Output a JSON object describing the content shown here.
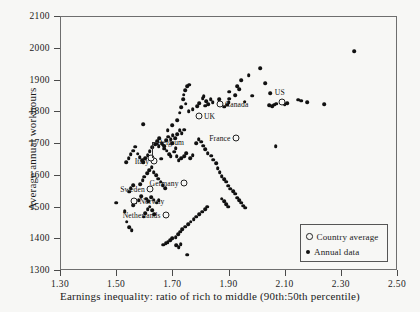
{
  "chart_data": {
    "type": "scatter",
    "title": "",
    "xlabel": "Earnings inequality: ratio of rich to middle (90th:50th percentile)",
    "ylabel": "Average annual workhours",
    "xlim": [
      1.3,
      2.5
    ],
    "ylim": [
      1300,
      2100
    ],
    "xticks": [
      "1.30",
      "1.50",
      "1.70",
      "1.90",
      "2.10",
      "2.30",
      "2.50"
    ],
    "xtick_values": [
      1.3,
      1.5,
      1.7,
      1.9,
      2.1,
      2.3,
      2.5
    ],
    "yticks": [
      "1300",
      "1400",
      "1500",
      "1600",
      "1700",
      "1800",
      "1900",
      "2000",
      "2100"
    ],
    "ytick_values": [
      1300,
      1400,
      1500,
      1600,
      1700,
      1800,
      1900,
      2000,
      2100
    ],
    "grid": false,
    "legend_position": "bottom-right",
    "legend": [
      {
        "marker": "open-circle",
        "label": "Country average"
      },
      {
        "marker": "filled-dot",
        "label": "Annual data"
      }
    ],
    "country_averages": [
      {
        "name": "Norway",
        "x": 1.565,
        "y": 1516,
        "label_side": "right"
      },
      {
        "name": "Sweden",
        "x": 1.62,
        "y": 1555,
        "label_side": "left"
      },
      {
        "name": "Netherlands",
        "x": 1.676,
        "y": 1472,
        "label_side": "left"
      },
      {
        "name": "Germany",
        "x": 1.74,
        "y": 1574,
        "label_side": "left"
      },
      {
        "name": "Italy",
        "x": 1.635,
        "y": 1643,
        "label_side": "left"
      },
      {
        "name": "Belgium",
        "x": 1.625,
        "y": 1654,
        "label_side": "leader"
      },
      {
        "name": "UK",
        "x": 1.795,
        "y": 1785,
        "label_side": "right"
      },
      {
        "name": "Canada",
        "x": 1.87,
        "y": 1822,
        "label_side": "right"
      },
      {
        "name": "France",
        "x": 1.925,
        "y": 1717,
        "label_side": "left"
      },
      {
        "name": "US",
        "x": 2.09,
        "y": 1828,
        "label_side": "above"
      }
    ],
    "annual_data": [
      {
        "x": 2.348,
        "y": 1990
      },
      {
        "x": 2.012,
        "y": 1935
      },
      {
        "x": 1.972,
        "y": 1913
      },
      {
        "x": 1.946,
        "y": 1898
      },
      {
        "x": 2.031,
        "y": 1888
      },
      {
        "x": 1.932,
        "y": 1879
      },
      {
        "x": 1.938,
        "y": 1869
      },
      {
        "x": 1.903,
        "y": 1862
      },
      {
        "x": 2.048,
        "y": 1856
      },
      {
        "x": 1.924,
        "y": 1851
      },
      {
        "x": 1.902,
        "y": 1839
      },
      {
        "x": 1.901,
        "y": 1829
      },
      {
        "x": 1.985,
        "y": 1849
      },
      {
        "x": 1.867,
        "y": 1838
      },
      {
        "x": 1.958,
        "y": 1830
      },
      {
        "x": 1.896,
        "y": 1820
      },
      {
        "x": 1.884,
        "y": 1814
      },
      {
        "x": 2.18,
        "y": 1828
      },
      {
        "x": 2.148,
        "y": 1836
      },
      {
        "x": 2.158,
        "y": 1833
      },
      {
        "x": 2.11,
        "y": 1826
      },
      {
        "x": 2.1,
        "y": 1822
      },
      {
        "x": 2.07,
        "y": 1824
      },
      {
        "x": 2.062,
        "y": 1820
      },
      {
        "x": 2.24,
        "y": 1822
      },
      {
        "x": 2.056,
        "y": 1816
      },
      {
        "x": 2.044,
        "y": 1819
      },
      {
        "x": 1.82,
        "y": 1832
      },
      {
        "x": 1.836,
        "y": 1838
      },
      {
        "x": 1.844,
        "y": 1828
      },
      {
        "x": 1.828,
        "y": 1822
      },
      {
        "x": 1.816,
        "y": 1818
      },
      {
        "x": 1.808,
        "y": 1842
      },
      {
        "x": 1.812,
        "y": 1848
      },
      {
        "x": 1.796,
        "y": 1826
      },
      {
        "x": 1.788,
        "y": 1816
      },
      {
        "x": 1.772,
        "y": 1806
      },
      {
        "x": 1.758,
        "y": 1800
      },
      {
        "x": 1.748,
        "y": 1824
      },
      {
        "x": 1.74,
        "y": 1852
      },
      {
        "x": 1.745,
        "y": 1866
      },
      {
        "x": 1.752,
        "y": 1878
      },
      {
        "x": 1.76,
        "y": 1884
      },
      {
        "x": 1.738,
        "y": 1838
      },
      {
        "x": 1.732,
        "y": 1812
      },
      {
        "x": 1.726,
        "y": 1796
      },
      {
        "x": 1.718,
        "y": 1772
      },
      {
        "x": 1.7,
        "y": 1756
      },
      {
        "x": 1.684,
        "y": 1740
      },
      {
        "x": 1.66,
        "y": 1650
      },
      {
        "x": 1.596,
        "y": 1760
      },
      {
        "x": 1.645,
        "y": 1700
      },
      {
        "x": 1.652,
        "y": 1690
      },
      {
        "x": 1.666,
        "y": 1695
      },
      {
        "x": 1.672,
        "y": 1682
      },
      {
        "x": 1.68,
        "y": 1676
      },
      {
        "x": 1.688,
        "y": 1664
      },
      {
        "x": 1.694,
        "y": 1658
      },
      {
        "x": 1.706,
        "y": 1672
      },
      {
        "x": 1.712,
        "y": 1684
      },
      {
        "x": 1.7,
        "y": 1700
      },
      {
        "x": 1.716,
        "y": 1658
      },
      {
        "x": 1.722,
        "y": 1646
      },
      {
        "x": 1.732,
        "y": 1652
      },
      {
        "x": 1.742,
        "y": 1658
      },
      {
        "x": 1.75,
        "y": 1668
      },
      {
        "x": 1.764,
        "y": 1652
      },
      {
        "x": 1.772,
        "y": 1662
      },
      {
        "x": 1.786,
        "y": 1700
      },
      {
        "x": 1.794,
        "y": 1712
      },
      {
        "x": 1.802,
        "y": 1704
      },
      {
        "x": 1.81,
        "y": 1692
      },
      {
        "x": 1.818,
        "y": 1680
      },
      {
        "x": 1.826,
        "y": 1668
      },
      {
        "x": 1.838,
        "y": 1660
      },
      {
        "x": 1.846,
        "y": 1648
      },
      {
        "x": 1.856,
        "y": 1636
      },
      {
        "x": 1.862,
        "y": 1620
      },
      {
        "x": 1.868,
        "y": 1608
      },
      {
        "x": 1.876,
        "y": 1596
      },
      {
        "x": 1.884,
        "y": 1586
      },
      {
        "x": 1.892,
        "y": 1578
      },
      {
        "x": 1.898,
        "y": 1566
      },
      {
        "x": 1.906,
        "y": 1556
      },
      {
        "x": 1.916,
        "y": 1548
      },
      {
        "x": 1.924,
        "y": 1540
      },
      {
        "x": 1.93,
        "y": 1528
      },
      {
        "x": 1.938,
        "y": 1520
      },
      {
        "x": 1.946,
        "y": 1512
      },
      {
        "x": 1.952,
        "y": 1502
      },
      {
        "x": 1.96,
        "y": 1496
      },
      {
        "x": 1.876,
        "y": 1524
      },
      {
        "x": 1.884,
        "y": 1516
      },
      {
        "x": 1.892,
        "y": 1508
      },
      {
        "x": 1.898,
        "y": 1500
      },
      {
        "x": 1.824,
        "y": 1500
      },
      {
        "x": 1.816,
        "y": 1492
      },
      {
        "x": 1.806,
        "y": 1484
      },
      {
        "x": 1.796,
        "y": 1476
      },
      {
        "x": 1.786,
        "y": 1468
      },
      {
        "x": 1.776,
        "y": 1460
      },
      {
        "x": 1.766,
        "y": 1452
      },
      {
        "x": 1.756,
        "y": 1444
      },
      {
        "x": 1.746,
        "y": 1436
      },
      {
        "x": 1.736,
        "y": 1428
      },
      {
        "x": 1.728,
        "y": 1420
      },
      {
        "x": 1.72,
        "y": 1412
      },
      {
        "x": 1.712,
        "y": 1404
      },
      {
        "x": 1.7,
        "y": 1400
      },
      {
        "x": 1.692,
        "y": 1394
      },
      {
        "x": 1.684,
        "y": 1388
      },
      {
        "x": 1.676,
        "y": 1384
      },
      {
        "x": 1.668,
        "y": 1380
      },
      {
        "x": 1.714,
        "y": 1378
      },
      {
        "x": 1.722,
        "y": 1372
      },
      {
        "x": 1.73,
        "y": 1382
      },
      {
        "x": 1.754,
        "y": 1348
      },
      {
        "x": 1.606,
        "y": 1524
      },
      {
        "x": 1.614,
        "y": 1516
      },
      {
        "x": 1.624,
        "y": 1530
      },
      {
        "x": 1.634,
        "y": 1522
      },
      {
        "x": 1.644,
        "y": 1512
      },
      {
        "x": 1.652,
        "y": 1520
      },
      {
        "x": 1.59,
        "y": 1532
      },
      {
        "x": 1.58,
        "y": 1520
      },
      {
        "x": 1.57,
        "y": 1512
      },
      {
        "x": 1.56,
        "y": 1504
      },
      {
        "x": 1.546,
        "y": 1546
      },
      {
        "x": 1.552,
        "y": 1558
      },
      {
        "x": 1.56,
        "y": 1568
      },
      {
        "x": 1.5,
        "y": 1512
      },
      {
        "x": 1.53,
        "y": 1486
      },
      {
        "x": 1.538,
        "y": 1452
      },
      {
        "x": 1.546,
        "y": 1434
      },
      {
        "x": 1.556,
        "y": 1426
      },
      {
        "x": 1.598,
        "y": 1468
      },
      {
        "x": 1.604,
        "y": 1478
      },
      {
        "x": 1.612,
        "y": 1492
      },
      {
        "x": 1.62,
        "y": 1500
      },
      {
        "x": 1.628,
        "y": 1488
      },
      {
        "x": 1.636,
        "y": 1476
      },
      {
        "x": 1.586,
        "y": 1570
      },
      {
        "x": 1.594,
        "y": 1582
      },
      {
        "x": 1.6,
        "y": 1594
      },
      {
        "x": 1.61,
        "y": 1604
      },
      {
        "x": 1.618,
        "y": 1614
      },
      {
        "x": 1.626,
        "y": 1624
      },
      {
        "x": 1.634,
        "y": 1608
      },
      {
        "x": 1.642,
        "y": 1598
      },
      {
        "x": 1.65,
        "y": 1588
      },
      {
        "x": 1.658,
        "y": 1578
      },
      {
        "x": 1.666,
        "y": 1568
      },
      {
        "x": 1.674,
        "y": 1558
      },
      {
        "x": 1.596,
        "y": 1640
      },
      {
        "x": 1.604,
        "y": 1652
      },
      {
        "x": 1.612,
        "y": 1662
      },
      {
        "x": 1.62,
        "y": 1674
      },
      {
        "x": 1.628,
        "y": 1686
      },
      {
        "x": 1.638,
        "y": 1696
      },
      {
        "x": 1.646,
        "y": 1706
      },
      {
        "x": 1.654,
        "y": 1716
      },
      {
        "x": 1.662,
        "y": 1700
      },
      {
        "x": 1.67,
        "y": 1690
      },
      {
        "x": 1.678,
        "y": 1708
      },
      {
        "x": 1.686,
        "y": 1720
      },
      {
        "x": 1.694,
        "y": 1712
      },
      {
        "x": 1.702,
        "y": 1724
      },
      {
        "x": 1.71,
        "y": 1716
      },
      {
        "x": 1.718,
        "y": 1728
      },
      {
        "x": 1.726,
        "y": 1740
      },
      {
        "x": 1.734,
        "y": 1730
      },
      {
        "x": 1.742,
        "y": 1742
      },
      {
        "x": 1.56,
        "y": 1676
      },
      {
        "x": 1.568,
        "y": 1688
      },
      {
        "x": 1.576,
        "y": 1666
      },
      {
        "x": 1.584,
        "y": 1656
      },
      {
        "x": 1.592,
        "y": 1646
      },
      {
        "x": 1.552,
        "y": 1664
      },
      {
        "x": 1.544,
        "y": 1652
      },
      {
        "x": 1.536,
        "y": 1640
      },
      {
        "x": 2.068,
        "y": 1690
      }
    ]
  }
}
